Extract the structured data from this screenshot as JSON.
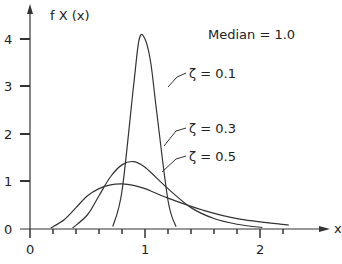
{
  "chart_data": {
    "type": "line",
    "title": "Median = 1.0",
    "xlabel": "x",
    "ylabel": "f X (x)",
    "xlim": [
      0,
      2.3
    ],
    "ylim": [
      0,
      4.3
    ],
    "x_ticks": [
      "0",
      "1",
      "2"
    ],
    "y_ticks": [
      "0",
      "1",
      "2",
      "3",
      "4"
    ],
    "grid": false,
    "series": [
      {
        "name": "ζ = 0.1",
        "x": [
          0.72,
          0.8,
          0.9,
          0.95,
          1.0,
          1.05,
          1.1,
          1.2,
          1.27
        ],
        "y": [
          0.05,
          0.8,
          3.0,
          4.0,
          4.0,
          3.5,
          2.5,
          0.6,
          0.05
        ]
      },
      {
        "name": "ζ = 0.3",
        "x": [
          0.37,
          0.5,
          0.6,
          0.7,
          0.8,
          0.9,
          1.0,
          1.2,
          1.4,
          1.6,
          1.8,
          2.02
        ],
        "y": [
          0.02,
          0.3,
          0.7,
          1.1,
          1.35,
          1.42,
          1.3,
          0.85,
          0.45,
          0.22,
          0.1,
          0.03
        ]
      },
      {
        "name": "ζ = 0.5",
        "x": [
          0.18,
          0.3,
          0.4,
          0.5,
          0.6,
          0.7,
          0.8,
          0.9,
          1.0,
          1.2,
          1.5,
          1.8,
          2.25
        ],
        "y": [
          0.02,
          0.2,
          0.45,
          0.7,
          0.85,
          0.93,
          0.95,
          0.92,
          0.85,
          0.65,
          0.4,
          0.22,
          0.08
        ]
      }
    ]
  },
  "labels": {
    "ylabel": "f X (x)",
    "xlabel": "x",
    "median": "Median  =  1.0",
    "s1": "ζ  =  0.1",
    "s2": "ζ  =  0.3",
    "s3": "ζ  =  0.5",
    "yt0": "0",
    "yt1": "1",
    "yt2": "2",
    "yt3": "3",
    "yt4": "4",
    "xt0": "0",
    "xt1": "1",
    "xt2": "2"
  }
}
